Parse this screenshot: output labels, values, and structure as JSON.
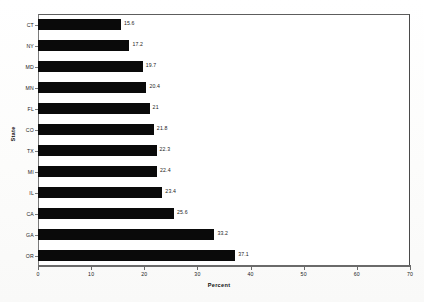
{
  "chart_data": {
    "type": "bar",
    "orientation": "horizontal",
    "title": "",
    "xlabel": "Percent",
    "ylabel": "State",
    "xlim": [
      0,
      70
    ],
    "xticks": [
      "0",
      "10",
      "20",
      "30",
      "40",
      "50",
      "60",
      "70"
    ],
    "grid": false,
    "legend": false,
    "bar_color": "#0a0a0a",
    "categories": [
      "CT",
      "NY",
      "MD",
      "MN",
      "FL",
      "CO",
      "TX",
      "MI",
      "IL",
      "CA",
      "GA",
      "OR"
    ],
    "values": [
      15.6,
      17.2,
      19.7,
      20.4,
      21,
      21.8,
      22.3,
      22.4,
      23.4,
      25.6,
      33.2,
      37.1
    ],
    "value_labels": [
      "15.6",
      "17.2",
      "19.7",
      "20.4",
      "21",
      "21.8",
      "22.3",
      "22.4",
      "23.4",
      "25.6",
      "33.2",
      "37.1"
    ]
  }
}
